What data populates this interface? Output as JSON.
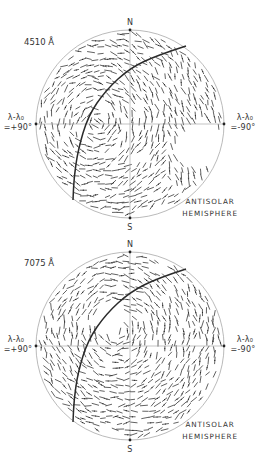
{
  "figure": {
    "panels": [
      {
        "id": "panel-4510",
        "wavelength_label": "4510 Å",
        "center": [
          130,
          124
        ],
        "radius": 94,
        "north_label": "N",
        "south_label": "S",
        "left_label_line1": "λ-λ₀",
        "left_label_line2": "=+90°",
        "right_label_line1": "λ-λ₀",
        "right_label_line2": "=-90°",
        "caption_line1": "ANTISOLAR",
        "caption_line2": "HEMISPHERE",
        "arc_points": [
          [
            186,
            46
          ],
          [
            158,
            55
          ],
          [
            130,
            68
          ],
          [
            106,
            90
          ],
          [
            88,
            116
          ],
          [
            78,
            150
          ],
          [
            74,
            178
          ],
          [
            73,
            200
          ]
        ],
        "hole": [
          200,
          146,
          24
        ],
        "swirl_center": [
          96,
          124
        ],
        "seed": 11
      },
      {
        "id": "panel-7075",
        "wavelength_label": "7075 Å",
        "center": [
          130,
          346
        ],
        "radius": 94,
        "north_label": "N",
        "south_label": "S",
        "left_label_line1": "λ-λ₀",
        "left_label_line2": "=+90°",
        "right_label_line1": "λ-λ₀",
        "right_label_line2": "=-90°",
        "caption_line1": "ANTISOLAR",
        "caption_line2": "HEMISPHERE",
        "arc_points": [
          [
            186,
            269
          ],
          [
            158,
            278
          ],
          [
            130,
            292
          ],
          [
            106,
            314
          ],
          [
            88,
            340
          ],
          [
            78,
            372
          ],
          [
            74,
            400
          ],
          [
            73,
            422
          ]
        ],
        "hole": [
          110,
          318,
          16
        ],
        "swirl_center": [
          118,
          330
        ],
        "seed": 29
      }
    ],
    "colors": {
      "ink": "#2e2e2e",
      "rim": "#a8a8a8",
      "axis": "#9a9a9a",
      "background": "#ffffff"
    }
  }
}
